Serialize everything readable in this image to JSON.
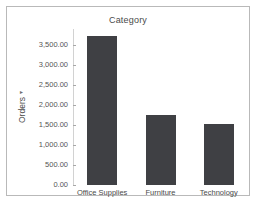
{
  "frame": {
    "border_color": "#b9b9b9",
    "background": "#ffffff"
  },
  "chart_data": {
    "type": "bar",
    "title": "Category",
    "xlabel": "",
    "ylabel": "Orders",
    "ylabel_sort_indicator": "▾",
    "categories": [
      "Office Supplies",
      "Furniture",
      "Technology"
    ],
    "values": [
      3720,
      1750,
      1530
    ],
    "ylim": [
      0,
      3900
    ],
    "ytick_values": [
      0,
      500,
      1000,
      1500,
      2000,
      2500,
      3000,
      3500
    ],
    "ytick_labels": [
      "0.00",
      "500.00",
      "1,000.00",
      "1,500.00",
      "2,000.00",
      "2,500.00",
      "3,000.00",
      "3,500.00"
    ],
    "grid": false,
    "legend": "none",
    "bar_color": "#3f4044",
    "axis_color": "#d2d2d2"
  }
}
